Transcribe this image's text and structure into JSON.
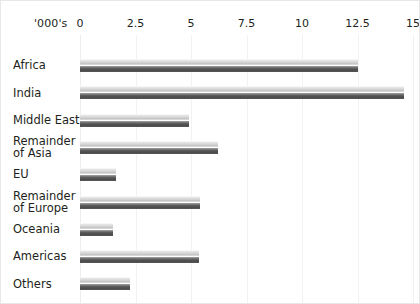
{
  "chart": {
    "unit_label": "'000's",
    "axis": {
      "ticks": [
        "0",
        "2.5",
        "5",
        "7.5",
        "10",
        "12.5",
        "15"
      ],
      "min": 0,
      "max": 15
    }
  },
  "chart_data": {
    "type": "bar",
    "orientation": "horizontal",
    "title": "",
    "subtitle": "",
    "xlabel": "'000's",
    "ylabel": "",
    "xlim": [
      0,
      15
    ],
    "grid": true,
    "legend": false,
    "tick_labels": [
      "0",
      "2.5",
      "5",
      "7.5",
      "10",
      "12.5",
      "15"
    ],
    "categories": [
      "Africa",
      "India",
      "Middle East",
      "Remainder\nof Asia",
      "EU",
      "Remainder\nof Europe",
      "Oceania",
      "Americas",
      "Others"
    ],
    "values": [
      12.5,
      14.6,
      4.9,
      6.2,
      1.6,
      5.4,
      1.5,
      5.35,
      2.25
    ]
  }
}
